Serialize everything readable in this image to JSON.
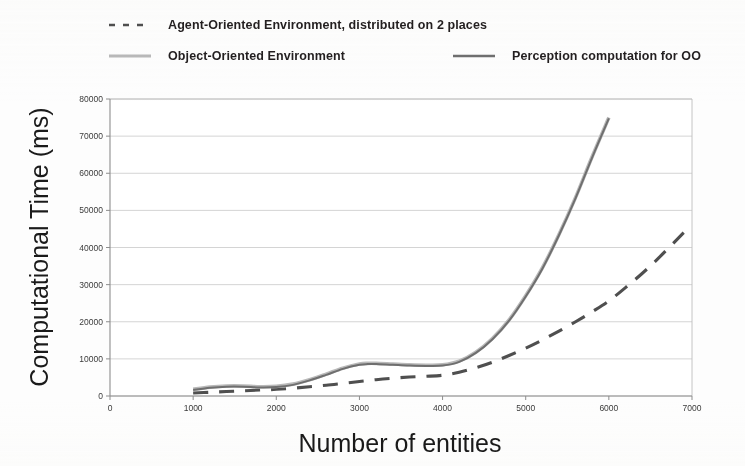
{
  "chart_data": {
    "type": "line",
    "title": "",
    "xlabel": "Number of entities",
    "ylabel": "Computational Time (ms)",
    "xlim": [
      0,
      7000
    ],
    "ylim": [
      0,
      80000
    ],
    "xticks": [
      0,
      1000,
      2000,
      3000,
      4000,
      5000,
      6000,
      7000
    ],
    "yticks": [
      0,
      10000,
      20000,
      30000,
      40000,
      50000,
      60000,
      70000,
      80000
    ],
    "xtick_labels": [
      "0",
      "1000",
      "2000",
      "3000",
      "4000",
      "5000",
      "6000",
      "7000"
    ],
    "ytick_labels": [
      "0",
      "10000",
      "20000",
      "30000",
      "40000",
      "50000",
      "60000",
      "70000",
      "80000"
    ],
    "grid": "horizontal",
    "legend_position": "above-plot",
    "series": [
      {
        "name": "Agent-Oriented Environment, distributed  on 2 places",
        "style": "dashed",
        "color": "#4f4f4f",
        "width": 3.1,
        "x": [
          1000,
          1200,
          1400,
          1600,
          1800,
          2000,
          2200,
          2400,
          2600,
          2800,
          3000,
          3200,
          3400,
          3600,
          3800,
          4000,
          4200,
          4400,
          4600,
          4800,
          5000,
          5200,
          5400,
          5600,
          5800,
          6000,
          6200,
          6400,
          6600,
          6900
        ],
        "y": [
          800,
          1000,
          1200,
          1400,
          1600,
          1800,
          2100,
          2500,
          2900,
          3400,
          3900,
          4400,
          4800,
          5100,
          5300,
          5600,
          6400,
          7600,
          9100,
          10900,
          12900,
          15100,
          17500,
          20000,
          22700,
          25600,
          29200,
          33000,
          37200,
          44000
        ]
      },
      {
        "name": "Object-Oriented Environment",
        "style": "solid",
        "color": "#b9b9b9",
        "width": 3.6,
        "x": [
          1000,
          1200,
          1400,
          1600,
          1800,
          2000,
          2200,
          2400,
          2600,
          2800,
          3000,
          3100,
          3200,
          3400,
          3600,
          3800,
          4000,
          4200,
          4400,
          4600,
          4800,
          5000,
          5200,
          5400,
          5600,
          5800,
          6000
        ],
        "y": [
          1800,
          2400,
          2700,
          2700,
          2500,
          2600,
          3200,
          4400,
          5900,
          7500,
          8600,
          8800,
          8800,
          8600,
          8400,
          8300,
          8400,
          9400,
          11800,
          15500,
          20500,
          27000,
          34500,
          43500,
          53500,
          64500,
          75000
        ]
      },
      {
        "name": "Perception computation for OO",
        "style": "solid",
        "color": "#6f6f6f",
        "width": 2.0,
        "x": [
          1000,
          1200,
          1400,
          1600,
          1800,
          2000,
          2200,
          2400,
          2600,
          2800,
          3000,
          3100,
          3200,
          3400,
          3600,
          3800,
          4000,
          4200,
          4400,
          4600,
          4800,
          5000,
          5200,
          5400,
          5600,
          5800,
          6000
        ],
        "y": [
          1600,
          2200,
          2500,
          2500,
          2300,
          2400,
          3000,
          4200,
          5700,
          7300,
          8400,
          8600,
          8600,
          8400,
          8200,
          8100,
          8200,
          9200,
          11600,
          15300,
          20300,
          26800,
          34300,
          43300,
          53300,
          64300,
          74800
        ]
      }
    ]
  },
  "legend": {
    "entries": [
      {
        "label": "Agent-Oriented Environment, distributed  on 2 places",
        "style": "dashed",
        "color": "#4f4f4f"
      },
      {
        "label": "Object-Oriented Environment",
        "style": "solid",
        "color": "#b9b9b9"
      },
      {
        "label": "Perception computation for OO",
        "style": "solid",
        "color": "#6f6f6f"
      }
    ]
  },
  "axes": {
    "x_title": "Number of entities",
    "y_title": "Computational Time (ms)"
  },
  "colors": {
    "background": "#ffffff",
    "grid": "#c9c9c9",
    "axis_line": "#8d8d8d",
    "text": "#231f20"
  }
}
